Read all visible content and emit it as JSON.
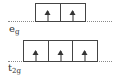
{
  "diagram": {
    "levels": [
      {
        "name": "eg",
        "label_main": "e",
        "label_sub": "g",
        "orbitals": [
          {
            "electron": "up"
          },
          {
            "electron": "up"
          }
        ]
      },
      {
        "name": "t2g",
        "label_main": "t",
        "label_sub": "2g",
        "orbitals": [
          {
            "electron": "up"
          },
          {
            "electron": "up"
          },
          {
            "electron": "up"
          }
        ]
      }
    ],
    "colors": {
      "line": "#444444",
      "dots": "#888888"
    }
  }
}
